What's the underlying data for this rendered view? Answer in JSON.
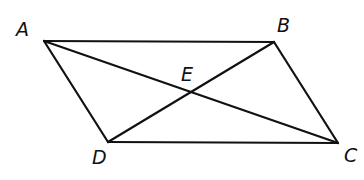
{
  "diagram": {
    "type": "parallelogram-with-diagonals",
    "line_color": "#111111",
    "background": "#ffffff",
    "points": {
      "A": {
        "label": "A",
        "x": 44,
        "y": 41,
        "label_x": 16,
        "label_y": 20
      },
      "B": {
        "label": "B",
        "x": 274,
        "y": 42,
        "label_x": 277,
        "label_y": 16
      },
      "C": {
        "label": "C",
        "x": 338,
        "y": 143,
        "label_x": 344,
        "label_y": 146
      },
      "D": {
        "label": "D",
        "x": 108,
        "y": 142,
        "label_x": 92,
        "label_y": 148
      },
      "E": {
        "label": "E",
        "x": 191,
        "y": 92,
        "label_x": 181,
        "label_y": 65
      }
    },
    "segments": [
      {
        "name": "AB",
        "from": "A",
        "to": "B"
      },
      {
        "name": "BC",
        "from": "B",
        "to": "C"
      },
      {
        "name": "CD",
        "from": "C",
        "to": "D"
      },
      {
        "name": "DA",
        "from": "D",
        "to": "A"
      },
      {
        "name": "AC",
        "from": "A",
        "to": "C"
      },
      {
        "name": "BD",
        "from": "B",
        "to": "D"
      }
    ]
  }
}
